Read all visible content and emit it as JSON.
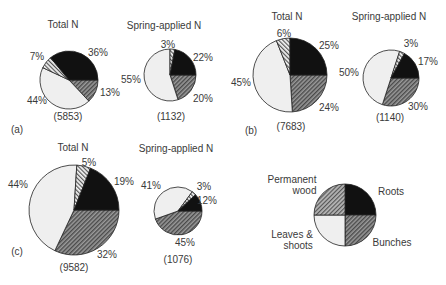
{
  "colors": {
    "roots": "#111111",
    "bunches": "#7a7a7a",
    "leaves": "#efefef",
    "wood": "#bdbdbd",
    "outline": "#222222"
  },
  "chart_data": [
    {
      "type": "pie",
      "panel": "(a)",
      "title": "Total N",
      "total": "(5853)",
      "categories": [
        "Roots",
        "Bunches",
        "Leaves & shoots",
        "Permanent wood"
      ],
      "values": [
        36,
        13,
        44,
        7
      ],
      "labels": [
        "36%",
        "13%",
        "44%",
        "7%"
      ]
    },
    {
      "type": "pie",
      "panel": "(a)",
      "title": "Spring-applied N",
      "total": "(1132)",
      "categories": [
        "Roots",
        "Bunches",
        "Leaves & shoots",
        "Permanent wood"
      ],
      "values": [
        22,
        20,
        55,
        3
      ],
      "labels": [
        "22%",
        "20%",
        "55%",
        "3%"
      ]
    },
    {
      "type": "pie",
      "panel": "(b)",
      "title": "Total N",
      "total": "(7683)",
      "categories": [
        "Roots",
        "Bunches",
        "Leaves & shoots",
        "Permanent wood"
      ],
      "values": [
        25,
        24,
        45,
        6
      ],
      "labels": [
        "25%",
        "24%",
        "45%",
        "6%"
      ]
    },
    {
      "type": "pie",
      "panel": "(b)",
      "title": "Spring-applied N",
      "total": "(1140)",
      "categories": [
        "Roots",
        "Bunches",
        "Leaves & shoots",
        "Permanent wood"
      ],
      "values": [
        17,
        30,
        50,
        3
      ],
      "labels": [
        "17%",
        "30%",
        "50%",
        "3%"
      ]
    },
    {
      "type": "pie",
      "panel": "(c)",
      "title": "Total N",
      "total": "(9582)",
      "categories": [
        "Roots",
        "Bunches",
        "Leaves & shoots",
        "Permanent wood"
      ],
      "values": [
        19,
        32,
        44,
        5
      ],
      "labels": [
        "19%",
        "32%",
        "44%",
        "5%"
      ]
    },
    {
      "type": "pie",
      "panel": "(c)",
      "title": "Spring-applied N",
      "total": "(1076)",
      "categories": [
        "Roots",
        "Bunches",
        "Leaves & shoots",
        "Permanent wood"
      ],
      "values": [
        12,
        45,
        41,
        3
      ],
      "labels": [
        "12%",
        "45%",
        "41%",
        "3%"
      ]
    }
  ],
  "legend": {
    "items": [
      {
        "key": "wood",
        "label_line1": "Permanent",
        "label_line2": "wood"
      },
      {
        "key": "roots",
        "label_line1": "Roots",
        "label_line2": ""
      },
      {
        "key": "leaves",
        "label_line1": "Leaves &",
        "label_line2": "shoots"
      },
      {
        "key": "bunches",
        "label_line1": "Bunches",
        "label_line2": ""
      }
    ]
  },
  "panels": {
    "a": "(a)",
    "b": "(b)",
    "c": "(c)"
  }
}
